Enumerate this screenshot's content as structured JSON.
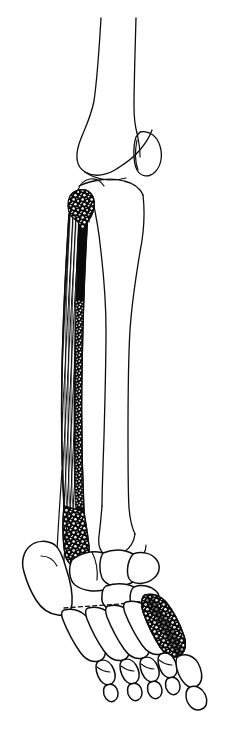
{
  "figure": {
    "title": "Lower limb skeleton, lateral oblique view",
    "caption": "",
    "background_color": "#ffffff",
    "ink_color": "#0d0d0d",
    "style": "ink line drawing with stippled and hatched shading",
    "view": "lateral oblique right lower limb",
    "canvas": {
      "width": 230,
      "height": 744
    }
  },
  "structures": [
    {
      "id": "femur-shaft",
      "label": "Femur shaft",
      "region": "thigh",
      "rendering": "plain outline"
    },
    {
      "id": "femoral-condyle",
      "label": "Femoral condyle",
      "region": "knee",
      "rendering": "plain outline"
    },
    {
      "id": "patella",
      "label": "Patella",
      "region": "knee",
      "rendering": "plain outline"
    },
    {
      "id": "tibia",
      "label": "Tibia",
      "region": "leg",
      "rendering": "plain outline"
    },
    {
      "id": "fibula",
      "label": "Fibula",
      "region": "leg",
      "rendering": "shaded graft segment with hatching and stipple"
    },
    {
      "id": "fibular-head",
      "label": "Fibular head osteotomy",
      "region": "proximal fibula",
      "rendering": "cut surface with cancellous stipple"
    },
    {
      "id": "lateral-malleolus",
      "label": "Lateral malleolus",
      "region": "ankle",
      "rendering": "cut surface with cancellous stipple"
    },
    {
      "id": "medial-malleolus",
      "label": "Distal tibia / medial malleolus",
      "region": "ankle",
      "rendering": "plain outline"
    },
    {
      "id": "calcaneus",
      "label": "Calcaneus",
      "region": "hindfoot",
      "rendering": "plain outline"
    },
    {
      "id": "talus",
      "label": "Talus",
      "region": "hindfoot",
      "rendering": "plain outline"
    },
    {
      "id": "tarsals",
      "label": "Tarsal bones",
      "region": "midfoot",
      "rendering": "plain outline with hidden dashed margins"
    },
    {
      "id": "metatarsal-five",
      "label": "Fifth metatarsal graft segment",
      "region": "forefoot",
      "rendering": "shaded graft segment with stipple"
    },
    {
      "id": "metatarsals",
      "label": "Metatarsals",
      "region": "forefoot",
      "rendering": "plain outline"
    },
    {
      "id": "phalanges",
      "label": "Phalanges",
      "region": "toes",
      "rendering": "plain outline"
    }
  ]
}
